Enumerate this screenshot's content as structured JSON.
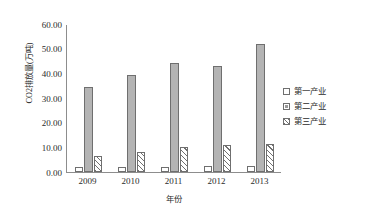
{
  "chart_data": {
    "type": "bar",
    "title": "",
    "xlabel": "年份",
    "ylabel": "CO2排放量(万吨)",
    "categories": [
      "2009",
      "2010",
      "2011",
      "2012",
      "2013"
    ],
    "series": [
      {
        "name": "第一产业",
        "values": [
          2.0,
          2.0,
          2.0,
          2.5,
          2.5
        ]
      },
      {
        "name": "第二产业",
        "values": [
          34.3,
          39.2,
          44.0,
          43.0,
          51.8
        ]
      },
      {
        "name": "第三产业",
        "values": [
          6.5,
          8.0,
          10.2,
          11.0,
          11.5
        ]
      }
    ],
    "ylim": [
      0,
      60
    ],
    "ytick_labels": [
      "60.00",
      "50.00",
      "40.00",
      "30.00",
      "20.00",
      "10.00",
      "0.00"
    ],
    "ytick_values": [
      60,
      50,
      40,
      30,
      20,
      10,
      0
    ],
    "grid": false,
    "legend_position": "right",
    "colors": {
      "series1": "#ffffff",
      "series2": "#b4b4b4",
      "series3_hatch": "#707070",
      "axis": "#8d8d8d",
      "bar_border": "#6f6f6f",
      "text": "#2b2b2b"
    }
  },
  "legend": {
    "items": [
      {
        "label": "第一产业",
        "swatch": "empty-square-swatch"
      },
      {
        "label": "第二产业",
        "swatch": "filled-square-swatch"
      },
      {
        "label": "第三产业",
        "swatch": "hatched-square-swatch"
      }
    ]
  }
}
